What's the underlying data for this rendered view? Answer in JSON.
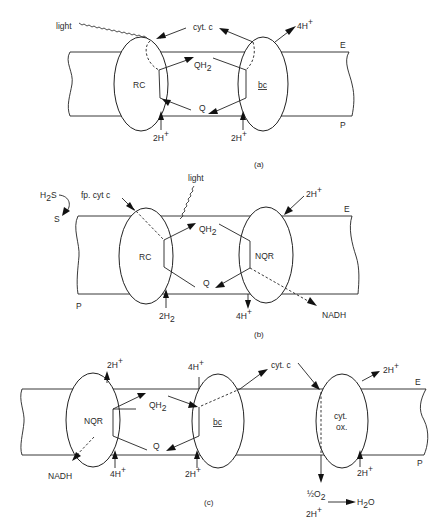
{
  "figure": {
    "panels": [
      {
        "id": "a",
        "caption": "(a)",
        "membrane_labels": {
          "top": "E",
          "bottom": "P"
        },
        "complexes": [
          {
            "name": "RC",
            "label": "RC"
          },
          {
            "name": "bc",
            "label": "bc",
            "underlined": true
          }
        ],
        "labels": {
          "light": "light",
          "cyt_c": "cyt. c",
          "protons_out": "4H",
          "protons_out_sup": "+",
          "qh2": "QH",
          "qh2_sub": "2",
          "q": "Q",
          "protons_rc": "2H",
          "protons_rc_sup": "+",
          "protons_bc": "2H",
          "protons_bc_sup": "+"
        }
      },
      {
        "id": "b",
        "caption": "(b)",
        "membrane_labels": {
          "top": "E",
          "bottom": "P"
        },
        "complexes": [
          {
            "name": "RC",
            "label": "RC"
          },
          {
            "name": "NQR",
            "label": "NQR"
          }
        ],
        "labels": {
          "light": "light",
          "h2s": "H",
          "h2s_sub": "2",
          "h2s_tail": "S",
          "s": "S",
          "fp_cyt_c": "fp. cyt c",
          "qh2": "QH",
          "qh2_sub": "2",
          "q": "Q",
          "protons_in": "2H",
          "protons_in_sup": "+",
          "protons_out": "4H",
          "protons_out_sup": "+",
          "nadh": "NADH",
          "h2": "2H",
          "h2_sub": "2"
        }
      },
      {
        "id": "c",
        "caption": "(c)",
        "membrane_labels": {
          "top": "E",
          "bottom": "P"
        },
        "complexes": [
          {
            "name": "NQR",
            "label": "NQR"
          },
          {
            "name": "bc",
            "label": "bc",
            "underlined": true
          },
          {
            "name": "cyt-ox",
            "label_line1": "cyt.",
            "label_line2": "ox."
          }
        ],
        "labels": {
          "nqr_protons_out": "2H",
          "nqr_protons_out_sup": "+",
          "bc_protons_out": "4H",
          "bc_protons_out_sup": "+",
          "cyt_c": "cyt. c",
          "ox_protons_out": "2H",
          "ox_protons_out_sup": "+",
          "qh2": "QH",
          "qh2_sub": "2",
          "q": "Q",
          "nadh": "NADH",
          "nqr_protons_in": "4H",
          "nqr_protons_in_sup": "+",
          "bc_protons_in": "2H",
          "bc_protons_in_sup": "+",
          "ox_protons_in": "2H",
          "ox_protons_in_sup": "+",
          "half_o2": "½O",
          "half_o2_sub": "2",
          "h2o": "H",
          "h2o_sub": "2",
          "h2o_tail": "O",
          "protons_o2": "2H",
          "protons_o2_sup": "+"
        }
      }
    ]
  }
}
